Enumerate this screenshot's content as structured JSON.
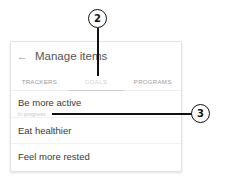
{
  "header": {
    "back_icon": "←",
    "title": "Manage items"
  },
  "tabs": [
    {
      "label": "TRACKERS",
      "active": false
    },
    {
      "label": "GOALS",
      "active": true
    },
    {
      "label": "PROGRAMS",
      "active": false
    }
  ],
  "list": {
    "items": [
      {
        "label": "Be more active",
        "sub": "In progress"
      },
      {
        "label": "Eat healthier"
      },
      {
        "label": "Feel more rested"
      }
    ]
  },
  "callouts": [
    {
      "number": "2"
    },
    {
      "number": "3"
    }
  ]
}
